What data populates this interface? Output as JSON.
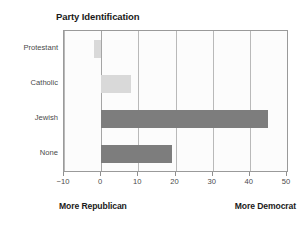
{
  "chart_data": {
    "type": "bar",
    "orientation": "horizontal",
    "title": "Party Identification",
    "xlabel": "",
    "ylabel": "",
    "categories": [
      "Protestant",
      "Catholic",
      "Jewish",
      "None"
    ],
    "values": [
      -2,
      8,
      45,
      19
    ],
    "bar_styles": [
      "light",
      "light",
      "dark",
      "dark"
    ],
    "xlim": [
      -10,
      50
    ],
    "xticks": [
      -10,
      0,
      10,
      20,
      30,
      40,
      50
    ],
    "xtick_labels": [
      "−10",
      "0",
      "10",
      "20",
      "30",
      "40",
      "50"
    ],
    "grid": true,
    "grid_axis": "x",
    "legend": false,
    "annotations": {
      "left": "More Republican",
      "right": "More Democrat"
    },
    "colors": {
      "light_bar": "#d9d9d9",
      "dark_bar": "#7d7d7d",
      "gridline": "#b9b9b9",
      "axis_border": "#9a9a9a",
      "plot_background": "#fcfcfc",
      "text": "#1a1a1a",
      "tick_text": "#4a4a4a"
    }
  }
}
